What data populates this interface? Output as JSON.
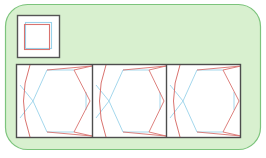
{
  "figure": {
    "canvas": {
      "width": 266,
      "height": 158,
      "background": "#ffffff"
    }
  },
  "colors": {
    "page_background": "#ffffff",
    "container_fill": "#d8f0cf",
    "container_stroke": "#7cc47c",
    "box_stroke": "#555555",
    "panel_stroke": "#4d4d4d",
    "divider_stroke": "#4d4d4d",
    "blue_line": "#9ad2ea",
    "red_line": "#d9736f",
    "cell_fill": "#ffffff",
    "thumb_fill": "#ffffff"
  },
  "container": {
    "label": "rounded-green-container",
    "x": 5,
    "y": 4,
    "width": 256,
    "height": 146,
    "radius": 22,
    "stroke_width": 1.2
  },
  "thumbnail_box": {
    "label": "thumbnail-square-box",
    "x": 17,
    "y": 15,
    "width": 43,
    "height": 43,
    "stroke_width": 1.4,
    "inner_square_blue": {
      "x": 25,
      "y": 22,
      "width": 27,
      "height": 27
    },
    "inner_square_red": {
      "x": 24,
      "y": 24,
      "width": 26,
      "height": 26
    }
  },
  "panel": {
    "label": "three-cell-panel",
    "x": 16,
    "y": 64,
    "width": 225,
    "height": 74,
    "stroke_width": 1.4,
    "dividers": [
      92,
      166
    ],
    "cells": [
      {
        "name": "cell-1",
        "x": 16,
        "width": 76,
        "hexagon": {
          "points": "33,100 46,70 74,70 90,100 74,132 46,132",
          "blue_edges": [
            "33,100 46,70",
            "46,70 74,70",
            "33,100 46,132",
            "46,132 74,132"
          ],
          "red_edges": [
            "74,70 90,100",
            "90,100 74,132"
          ]
        },
        "arc": {
          "d": "M 29,66 Q 17,100 29,136",
          "color": "#d9736f"
        },
        "diagonals_red": [
          "74,70 92,66",
          "74,132 92,136"
        ],
        "diagonals_blue": [
          "46,70 33,100",
          "46,132 33,100"
        ]
      },
      {
        "name": "cell-2",
        "x": 92,
        "width": 74,
        "hexagon": {
          "points": "109,100 122,70 148,70 164,100 148,132 122,132",
          "blue_edges": [
            "109,100 122,70",
            "122,70 148,70",
            "109,100 122,132",
            "122,132 148,132"
          ],
          "red_edges": [
            "148,70 164,100",
            "164,100 148,132"
          ]
        },
        "arc": {
          "d": "M 105,66 Q 93,100 105,136",
          "color": "#d9736f"
        },
        "diagonals_red": [
          "148,70 166,66",
          "148,132 166,136"
        ],
        "diagonals_blue": [
          "122,70 109,100",
          "122,132 109,100"
        ]
      },
      {
        "name": "cell-3",
        "x": 166,
        "width": 75,
        "hexagon": {
          "points": "183,100 196,70 223,70 239,100 223,132 196,132",
          "blue_edges": [
            "183,100 196,70",
            "196,70 223,70",
            "183,100 196,132",
            "196,132 223,132"
          ],
          "red_edges": [
            "223,70 239,100",
            "239,100 223,132"
          ]
        },
        "arc": {
          "d": "M 179,66 Q 167,100 179,136",
          "color": "#d9736f"
        },
        "diagonals_red": [
          "223,70 241,66",
          "223,132 241,136"
        ],
        "diagonals_blue": [
          "196,70 183,100",
          "196,132 183,100"
        ]
      }
    ]
  },
  "stroke_widths": {
    "thin_line": 0.9,
    "arc": 1.0,
    "frame": 1.4
  }
}
